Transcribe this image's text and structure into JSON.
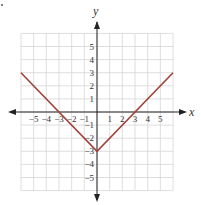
{
  "chart_data": {
    "type": "line",
    "title": "",
    "function": "y = |x| - 3",
    "xlabel": "x",
    "ylabel": "y",
    "xlim": [
      -6,
      6
    ],
    "ylim": [
      -6,
      6
    ],
    "grid": true,
    "x_ticks": [
      -5,
      -4,
      -3,
      -2,
      -1,
      1,
      2,
      3,
      4,
      5
    ],
    "y_ticks": [
      5,
      4,
      3,
      2,
      1,
      -1,
      -2,
      -3,
      -4,
      -5
    ],
    "x_tick_labels": [
      "−5",
      "−4",
      "−3",
      "−2",
      "−1",
      "1",
      "2",
      "3",
      "4",
      "5"
    ],
    "y_tick_labels": [
      "5",
      "4",
      "3",
      "2",
      "1",
      "−1",
      "−2",
      "−3",
      "−4",
      "−5"
    ],
    "series": [
      {
        "name": "y = |x| - 3",
        "color": "#a0413a",
        "points": [
          [
            -6,
            3
          ],
          [
            0,
            -3
          ],
          [
            6,
            3
          ]
        ]
      }
    ]
  },
  "colors": {
    "grid": "#d6d6d6",
    "axis": "#222222",
    "line": "#a0413a"
  }
}
